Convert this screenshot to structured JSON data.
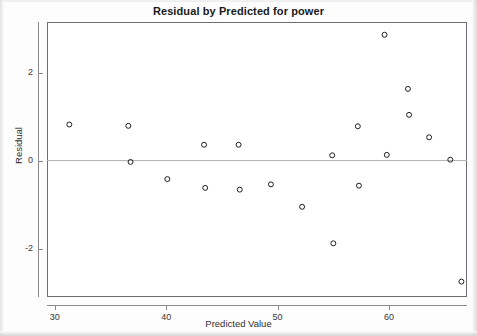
{
  "chart_data": {
    "type": "scatter",
    "title": "Residual by Predicted for power",
    "xlabel": "Predicted Value",
    "ylabel": "Residual",
    "xlim": [
      29.3,
      67.0
    ],
    "ylim": [
      -3.1,
      3.15
    ],
    "xticks": [
      30,
      40,
      50,
      60
    ],
    "xtick_labels": [
      "30",
      "40",
      "50",
      "60"
    ],
    "yticks": [
      2,
      0,
      -2
    ],
    "ytick_labels": [
      "2",
      "0",
      "-2"
    ],
    "grid": false,
    "legend": null,
    "reference_line": {
      "y": 0,
      "color": "#b0b0b0"
    },
    "marker": {
      "shape": "open-circle",
      "size": 4,
      "edge_color": "#1f1f1f",
      "fill": "none"
    },
    "points": [
      {
        "x": 31.3,
        "y": 0.82
      },
      {
        "x": 36.6,
        "y": 0.79
      },
      {
        "x": 36.8,
        "y": -0.03
      },
      {
        "x": 40.1,
        "y": -0.42
      },
      {
        "x": 43.4,
        "y": 0.36
      },
      {
        "x": 43.5,
        "y": -0.62
      },
      {
        "x": 46.5,
        "y": 0.36
      },
      {
        "x": 46.6,
        "y": -0.66
      },
      {
        "x": 49.4,
        "y": -0.54
      },
      {
        "x": 52.2,
        "y": -1.05
      },
      {
        "x": 54.9,
        "y": 0.12
      },
      {
        "x": 55.0,
        "y": -1.88
      },
      {
        "x": 57.2,
        "y": 0.78
      },
      {
        "x": 57.3,
        "y": -0.57
      },
      {
        "x": 59.6,
        "y": 2.86
      },
      {
        "x": 59.8,
        "y": 0.13
      },
      {
        "x": 61.7,
        "y": 1.63
      },
      {
        "x": 61.8,
        "y": 1.04
      },
      {
        "x": 63.6,
        "y": 0.53
      },
      {
        "x": 65.5,
        "y": 0.02
      },
      {
        "x": 66.5,
        "y": -2.75
      }
    ]
  },
  "figure": {
    "title": "Residual by Predicted for power"
  }
}
